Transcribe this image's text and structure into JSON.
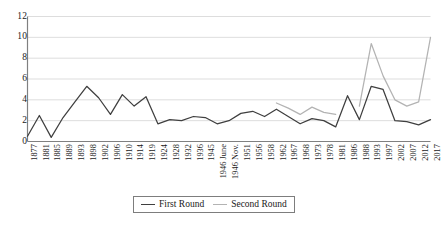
{
  "chart_data": {
    "type": "line",
    "title": "",
    "subtitle": "",
    "xlabel": "",
    "ylabel": "",
    "ylim": [
      0,
      12
    ],
    "y_ticks": [
      0,
      2,
      4,
      6,
      8,
      10,
      12
    ],
    "grid": "horizontal",
    "legend_position": "bottom-center",
    "categories": [
      "1877",
      "1881",
      "1885",
      "1889",
      "1893",
      "1898",
      "1902",
      "1906",
      "1910",
      "1914",
      "1919",
      "1924",
      "1928",
      "1932",
      "1936",
      "1945",
      "1946 June",
      "1946 Nov.",
      "1951",
      "1956",
      "1958",
      "1962",
      "1967",
      "1968",
      "1973",
      "1978",
      "1981",
      "1986",
      "1988",
      "1993",
      "1997",
      "2002",
      "2007",
      "2012",
      "2017"
    ],
    "series": [
      {
        "name": "First Round",
        "color": "#3f3f3f",
        "values": [
          0.5,
          2.5,
          0.4,
          2.3,
          3.8,
          5.3,
          4.2,
          2.6,
          4.5,
          3.4,
          4.3,
          1.7,
          2.1,
          2.0,
          2.4,
          2.3,
          1.7,
          2.0,
          2.7,
          2.9,
          2.4,
          3.1,
          2.4,
          1.7,
          2.2,
          2.0,
          1.4,
          4.4,
          2.1,
          5.3,
          5.0,
          2.0,
          1.9,
          1.6,
          2.1
        ]
      },
      {
        "name": "Second Round",
        "color": "#b3b3b3",
        "values": [
          null,
          null,
          null,
          null,
          null,
          null,
          null,
          null,
          null,
          null,
          null,
          null,
          null,
          null,
          null,
          null,
          null,
          null,
          null,
          null,
          null,
          3.7,
          3.2,
          2.6,
          3.3,
          2.8,
          2.6,
          null,
          3.4,
          9.4,
          6.3,
          4.0,
          3.4,
          3.8,
          10.0
        ]
      }
    ]
  },
  "legend": {
    "entries": [
      {
        "label": "First Round"
      },
      {
        "label": "Second Round"
      }
    ]
  },
  "colors": {
    "first_round": "#3f3f3f",
    "second_round": "#b3b3b3",
    "grid": "#d4d4d4",
    "axis": "#808080",
    "text": "#1a1a1a"
  }
}
